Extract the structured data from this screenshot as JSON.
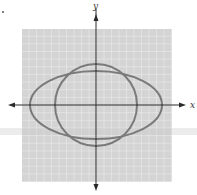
{
  "figure": {
    "type": "coordinate-graph",
    "axes": {
      "x_label": "x",
      "y_label": "y",
      "origin_px": [
        96,
        105
      ],
      "x_axis_px": [
        8,
        186
      ],
      "y_axis_px": [
        3,
        191
      ],
      "arrowheads": "both-ends"
    },
    "grid": {
      "bounds_px": {
        "x": 22,
        "y": 29,
        "width": 150,
        "height": 153
      },
      "cells_x": 20,
      "cells_y": 20,
      "background_color": "#d4d4d4",
      "line_color": "#f2f2f2"
    },
    "curves": [
      {
        "name": "circle",
        "shape": "circle",
        "center_px": [
          96,
          105
        ],
        "radius_px": 41,
        "stroke_color": "#7a7a7a",
        "stroke_width": 2
      },
      {
        "name": "ellipse",
        "shape": "ellipse",
        "center_px": [
          96,
          105
        ],
        "rx_px": 66,
        "ry_px": 34,
        "stroke_color": "#7a7a7a",
        "stroke_width": 2
      }
    ],
    "colors": {
      "axis": "#2a2a2a",
      "curve": "#7a7a7a",
      "grid_bg": "#d4d4d4",
      "smudge": "#c8c8c8"
    }
  }
}
